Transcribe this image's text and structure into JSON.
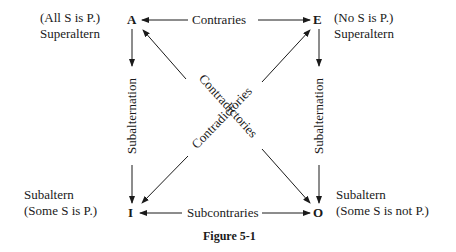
{
  "diagram": {
    "corners": {
      "A": {
        "letter": "A",
        "proposition": "(All S is P.)",
        "role": "Superaltern"
      },
      "E": {
        "letter": "E",
        "proposition": "(No S is P.)",
        "role": "Superaltern"
      },
      "I": {
        "letter": "I",
        "proposition": "(Some S is P.)",
        "role": "Subaltern"
      },
      "O": {
        "letter": "O",
        "proposition": "(Some S is not P.)",
        "role": "Subaltern"
      }
    },
    "relations": {
      "top": "Contraries",
      "bottom": "Subcontraries",
      "left": "Subalternation",
      "right": "Subalternation",
      "diag1": "Contradictories",
      "diag2": "Contradictories"
    },
    "caption": "Figure 5-1"
  }
}
